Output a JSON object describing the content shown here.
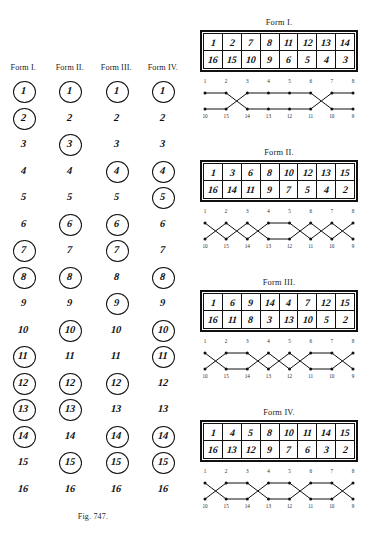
{
  "figure_747": {
    "caption": "Fig. 747.",
    "column_headers": [
      "Form I.",
      "Form II.",
      "Form III.",
      "Form IV."
    ],
    "row_numbers": [
      1,
      2,
      3,
      4,
      5,
      6,
      7,
      8,
      9,
      10,
      11,
      12,
      13,
      14,
      15,
      16
    ],
    "columns": [
      {
        "header": "Form I.",
        "circled": [
          1,
          2,
          7,
          8,
          11,
          12,
          13,
          14
        ]
      },
      {
        "header": "Form II.",
        "circled": [
          1,
          3,
          6,
          8,
          10,
          12,
          13,
          15
        ]
      },
      {
        "header": "Form III.",
        "circled": [
          1,
          4,
          6,
          7,
          9,
          12,
          14,
          15
        ]
      },
      {
        "header": "Form IV.",
        "circled": [
          1,
          4,
          5,
          8,
          10,
          11,
          14,
          15
        ]
      }
    ]
  },
  "figure_748": {
    "caption": "Fig. 748.",
    "forms": [
      {
        "title": "Form I.",
        "table_top": [
          1,
          2,
          7,
          8,
          11,
          12,
          13,
          14
        ],
        "table_bottom": [
          16,
          15,
          10,
          9,
          6,
          5,
          4,
          3
        ],
        "lattice_top_labels": [
          1,
          2,
          3,
          4,
          5,
          6,
          7,
          8
        ],
        "lattice_bottom_labels": [
          10,
          15,
          14,
          13,
          12,
          11,
          10,
          9
        ],
        "crossings": [
          false,
          true,
          false,
          false,
          false,
          true,
          false
        ]
      },
      {
        "title": "Form II.",
        "table_top": [
          1,
          3,
          6,
          8,
          10,
          12,
          13,
          15
        ],
        "table_bottom": [
          16,
          14,
          11,
          9,
          7,
          5,
          4,
          2
        ],
        "lattice_top_labels": [
          1,
          2,
          3,
          4,
          5,
          6,
          7,
          8
        ],
        "lattice_bottom_labels": [
          10,
          15,
          14,
          13,
          12,
          11,
          10,
          9
        ],
        "crossings": [
          true,
          true,
          true,
          false,
          true,
          true,
          true
        ]
      },
      {
        "title": "Form III.",
        "table_top": [
          1,
          6,
          9,
          14,
          4,
          7,
          12,
          15
        ],
        "table_bottom": [
          16,
          11,
          8,
          3,
          13,
          10,
          5,
          2
        ],
        "lattice_top_labels": [
          1,
          2,
          3,
          4,
          5,
          6,
          7,
          8
        ],
        "lattice_bottom_labels": [
          10,
          15,
          14,
          13,
          12,
          11,
          10,
          9
        ],
        "crossings": [
          true,
          false,
          true,
          true,
          true,
          false,
          true
        ]
      },
      {
        "title": "Form IV.",
        "table_top": [
          1,
          4,
          5,
          8,
          10,
          11,
          14,
          15
        ],
        "table_bottom": [
          16,
          13,
          12,
          9,
          7,
          6,
          3,
          2
        ],
        "lattice_top_labels": [
          1,
          2,
          3,
          4,
          5,
          6,
          7,
          8
        ],
        "lattice_bottom_labels": [
          10,
          15,
          14,
          13,
          12,
          11,
          10,
          9
        ],
        "crossings": [
          true,
          false,
          true,
          false,
          true,
          false,
          true
        ]
      }
    ]
  }
}
